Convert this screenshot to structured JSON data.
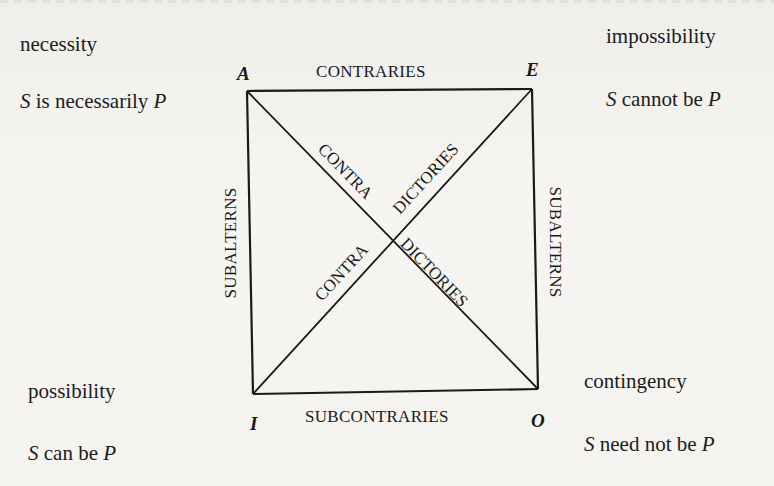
{
  "diagram": {
    "corners": {
      "A": {
        "letter": "A",
        "modality": "necessity",
        "formula": {
          "subject": "S",
          "copula": " is necessarily ",
          "predicate": "P"
        }
      },
      "E": {
        "letter": "E",
        "modality": "impossibility",
        "formula": {
          "subject": "S",
          "copula": " cannot be ",
          "predicate": "P"
        }
      },
      "I": {
        "letter": "I",
        "modality": "possibility",
        "formula": {
          "subject": "S",
          "copula": " can be ",
          "predicate": "P"
        }
      },
      "O": {
        "letter": "O",
        "modality": "contingency",
        "formula": {
          "subject": "S",
          "copula": " need not be ",
          "predicate": "P"
        }
      }
    },
    "relations": {
      "top": "CONTRARIES",
      "bottom": "SUBCONTRARIES",
      "left": "SUBALTERNS",
      "right": "SUBALTERNS",
      "diagonal_ao_upper": "CONTRADICTORIES",
      "diagonal_ie_upper": "DICTORIES",
      "diagonal_ie_lower": "CONTRA",
      "diagonal_ao_lower_a": "CONTRA",
      "diagonal_ao_lower_b": "DICTORIES"
    },
    "geometry": {
      "A": [
        247,
        91
      ],
      "E": [
        532,
        89
      ],
      "I": [
        253,
        394
      ],
      "O": [
        538,
        389
      ]
    },
    "colors": {
      "paper": "#f4f3ef",
      "ink": "#1a1a1a"
    }
  }
}
